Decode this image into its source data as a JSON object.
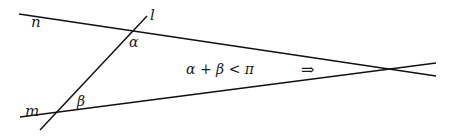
{
  "diagram": {
    "lines": [
      {
        "name": "n",
        "x1": 19,
        "y1": 14,
        "x2": 436,
        "y2": 76
      },
      {
        "name": "m",
        "x1": 20,
        "y1": 117,
        "x2": 436,
        "y2": 63
      },
      {
        "name": "l",
        "x1": 40,
        "y1": 130,
        "x2": 147,
        "y2": 16
      }
    ],
    "labels": {
      "line_n": "n",
      "line_m": "m",
      "line_l": "l",
      "angle_alpha": "α",
      "angle_beta": "β",
      "condition": "α + β < π",
      "implies": "⇒"
    },
    "intersection": {
      "x": 393,
      "y": 69
    },
    "stroke_color": "#111111"
  }
}
